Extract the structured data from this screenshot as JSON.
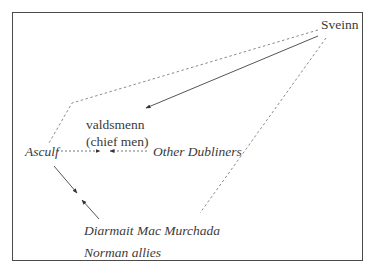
{
  "diagram": {
    "nodes": {
      "sveinn": {
        "label": "Sveinn",
        "style": "upright"
      },
      "valdsmenn": {
        "label": "valdsmenn",
        "sublabel": "(chief men)",
        "style": "upright"
      },
      "asculf": {
        "label": "Asculf",
        "style": "italic"
      },
      "other_dubliners": {
        "label": "Other Dubliners",
        "style": "italic"
      },
      "diarmait": {
        "label": "Diarmait Mac Murchada",
        "style": "italic"
      },
      "norman_allies": {
        "label": "Norman allies",
        "style": "italic"
      }
    },
    "edges": [
      {
        "from": "Sveinn",
        "to": "valdsmenn (chief men)",
        "line": "solid",
        "arrow": "end"
      },
      {
        "from": "Sveinn",
        "to": "Asculf",
        "line": "dashed",
        "arrow": "none"
      },
      {
        "from": "Sveinn",
        "to": "Diarmait Mac Murchada / Norman allies",
        "line": "dashed",
        "arrow": "none"
      },
      {
        "from": "Asculf",
        "to": "valdsmenn (chief men)",
        "line": "dotted",
        "arrow": "end"
      },
      {
        "from": "Other Dubliners",
        "to": "valdsmenn (chief men)",
        "line": "dotted",
        "arrow": "end"
      },
      {
        "from": "Asculf",
        "to": "center-bottom",
        "line": "solid",
        "arrow": "end"
      },
      {
        "from": "Diarmait Mac Murchada / Norman allies",
        "to": "center-bottom",
        "line": "solid",
        "arrow": "end"
      }
    ],
    "colors": {
      "frame": "#4a4a4a",
      "text": "#3a3a3a",
      "lines": "#555555",
      "dashed": "#888888"
    }
  }
}
